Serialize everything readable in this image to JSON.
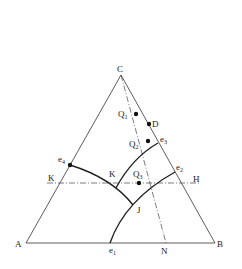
{
  "diagram": {
    "type": "ternary-phase-diagram",
    "vertices": {
      "A": {
        "label": "A",
        "x": 26,
        "y": 243
      },
      "B": {
        "label": "B",
        "x": 215,
        "y": 243
      },
      "C": {
        "label": "C",
        "x": 121,
        "y": 75
      }
    },
    "labels": [
      {
        "id": "C",
        "text": "C",
        "x": 117,
        "y": 72
      },
      {
        "id": "A",
        "text": "A",
        "x": 15,
        "y": 247
      },
      {
        "id": "B",
        "text": "B",
        "x": 217,
        "y": 247
      },
      {
        "id": "Q1",
        "text": "Q",
        "sub": "1",
        "x": 118,
        "y": 117
      },
      {
        "id": "D",
        "text": "D",
        "x": 152,
        "y": 127
      },
      {
        "id": "Q2",
        "text": "Q",
        "sub": "2",
        "x": 129,
        "y": 147
      },
      {
        "id": "e3",
        "text": "e",
        "sub": "3",
        "x": 160,
        "y": 142
      },
      {
        "id": "e4",
        "text": "e",
        "sub": "4",
        "x": 58,
        "y": 162
      },
      {
        "id": "e2",
        "text": "e",
        "sub": "2",
        "x": 176,
        "y": 170
      },
      {
        "id": "K-left",
        "text": "K",
        "x": 48,
        "y": 181
      },
      {
        "id": "K-mid",
        "text": "K",
        "x": 109,
        "y": 177
      },
      {
        "id": "Q3",
        "text": "Q",
        "sub": "3",
        "x": 133,
        "y": 177
      },
      {
        "id": "H",
        "text": "H",
        "x": 193,
        "y": 182
      },
      {
        "id": "J",
        "text": "J",
        "x": 137,
        "y": 213
      },
      {
        "id": "e1",
        "text": "e",
        "sub": "1",
        "x": 109,
        "y": 253
      },
      {
        "id": "N",
        "text": "N",
        "x": 161,
        "y": 254
      }
    ],
    "points": [
      {
        "id": "Q1",
        "x": 136,
        "y": 114
      },
      {
        "id": "D",
        "x": 149,
        "y": 124
      },
      {
        "id": "Q2",
        "x": 148,
        "y": 141
      },
      {
        "id": "e4",
        "x": 70,
        "y": 165
      },
      {
        "id": "Q3",
        "x": 139,
        "y": 183
      }
    ],
    "curves": [
      {
        "id": "e4-J",
        "d": "M70 165 Q 112 178 133 205"
      },
      {
        "id": "e3-K",
        "d": "M158 143 Q 132 158 116 188"
      },
      {
        "id": "e2-e1",
        "d": "M175 172 Q 125 200 110 243"
      }
    ],
    "dashdot_lines": [
      {
        "id": "C-N",
        "x1": 121,
        "y1": 75,
        "x2": 166,
        "y2": 243
      },
      {
        "id": "K-H",
        "x1": 47,
        "y1": 183,
        "x2": 200,
        "y2": 183
      }
    ]
  }
}
